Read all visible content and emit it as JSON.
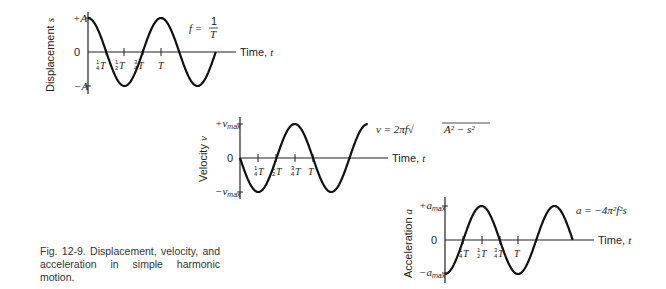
{
  "caption": "Fig. 12-9.   Displacement, velocity, and acceleration in simple harmonic motion.",
  "chart_data": [
    {
      "type": "line",
      "title": "Displacement",
      "ylabel": "Displacement s",
      "xlabel": "Time, t",
      "yticks": [
        "+A",
        "0",
        "−A"
      ],
      "xticks": [
        "¼T",
        "½T",
        "¾T",
        "T"
      ],
      "equation": "f = 1/T",
      "function": "s = A cos(2πt/T)",
      "x": [
        0,
        0.25,
        0.5,
        0.75,
        1.0,
        1.25,
        1.5,
        1.75
      ],
      "values": [
        1,
        0,
        -1,
        0,
        1,
        0,
        -1,
        0
      ],
      "ylim": [
        -1,
        1
      ]
    },
    {
      "type": "line",
      "title": "Velocity",
      "ylabel": "Velocity v",
      "xlabel": "Time, t",
      "yticks": [
        "+v_max",
        "0",
        "−v_max"
      ],
      "xticks": [
        "¼T",
        "½T",
        "¾T",
        "T"
      ],
      "equation": "v = 2πf√(A² − s²)",
      "function": "v = −v_max sin(2πt/T)",
      "x": [
        0,
        0.25,
        0.5,
        0.75,
        1.0,
        1.25,
        1.5,
        1.75
      ],
      "values": [
        0,
        -1,
        0,
        1,
        0,
        -1,
        0,
        1
      ],
      "ylim": [
        -1,
        1
      ]
    },
    {
      "type": "line",
      "title": "Acceleration",
      "ylabel": "Acceleration a",
      "xlabel": "Time, t",
      "yticks": [
        "+a_max",
        "0",
        "−a_max"
      ],
      "xticks": [
        "¼T",
        "½T",
        "¾T",
        "T"
      ],
      "equation": "a = −4π²f²s",
      "function": "a = −a_max cos(2πt/T)",
      "x": [
        0,
        0.25,
        0.5,
        0.75,
        1.0,
        1.25,
        1.5,
        1.75
      ],
      "values": [
        -1,
        0,
        1,
        0,
        -1,
        0,
        1,
        0
      ],
      "ylim": [
        -1,
        1
      ]
    }
  ],
  "labels": {
    "time": "Time, ",
    "t": "t",
    "disp_axis": "Displacement ",
    "disp_var": "s",
    "vel_axis": "Velocity ",
    "vel_var": "v",
    "acc_axis": "Acceleration ",
    "acc_var": "a",
    "plusA": "+A",
    "minusA": "−A",
    "zero": "0",
    "plus": "+",
    "minus": "−",
    "vmax_v": "v",
    "amax_a": "a",
    "max": "max",
    "T": "T",
    "q1": "1",
    "q4": "4",
    "h2": "2",
    "q3": "3",
    "eq_f": "f = ",
    "eq_v": "v = 2πf√",
    "eq_v_rad": "A² − s²",
    "eq_a": "a = −4π²f²s"
  }
}
